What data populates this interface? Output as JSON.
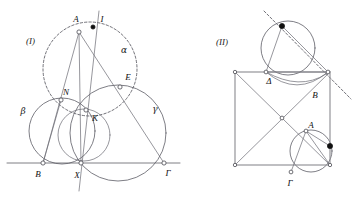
{
  "page": {
    "width": 363,
    "height": 200,
    "background": "#ffffff"
  },
  "colors": {
    "ink_main": "#5d5d66",
    "ink_thin": "#6a6a72",
    "ink_dash": "#4c4c55",
    "ink_square": "#8a8a90",
    "label_text": "#111111",
    "dot_filled": "#101010",
    "dot_open_fill": "#ffffff"
  },
  "figures": [
    {
      "id": "figure-one",
      "caption": "(I)",
      "caption_pos": {
        "x": 26,
        "y": 44
      },
      "point_labels": [
        {
          "name": "A",
          "text": "A",
          "x": 76,
          "y": 22
        },
        {
          "name": "I",
          "text": "I",
          "x": 102,
          "y": 22
        },
        {
          "name": "E",
          "text": "E",
          "x": 128,
          "y": 80
        },
        {
          "name": "N",
          "text": "N",
          "x": 66,
          "y": 95
        },
        {
          "name": "K",
          "text": "K",
          "x": 95,
          "y": 121
        },
        {
          "name": "B",
          "text": "B",
          "x": 38,
          "y": 177
        },
        {
          "name": "X",
          "text": "X",
          "x": 77,
          "y": 178
        },
        {
          "name": "G",
          "text": "Γ",
          "x": 168,
          "y": 176
        }
      ],
      "circle_labels": [
        {
          "name": "alpha",
          "text": "α",
          "x": 124,
          "y": 53
        },
        {
          "name": "beta",
          "text": "β",
          "x": 23,
          "y": 114
        },
        {
          "name": "gamma",
          "text": "γ",
          "x": 155,
          "y": 112
        }
      ],
      "circles": [
        {
          "name": "circle-alpha-dashed",
          "cx": 90,
          "cy": 69,
          "r": 47,
          "style": "dashed"
        },
        {
          "name": "circle-beta",
          "cx": 62,
          "cy": 131,
          "r": 33,
          "style": "solid"
        },
        {
          "name": "circle-gamma",
          "cx": 118,
          "cy": 133,
          "r": 48,
          "style": "solid"
        },
        {
          "name": "circle-small-K",
          "cx": 84,
          "cy": 135,
          "r": 26,
          "style": "solid"
        }
      ],
      "baseline": {
        "name": "line-B-Gamma",
        "x1": 7,
        "y1": 163,
        "x2": 180,
        "y2": 163
      },
      "segments": [
        {
          "name": "segment-A-B",
          "x1": 79,
          "y1": 32,
          "x2": 43,
          "y2": 163
        },
        {
          "name": "segment-A-Gamma",
          "x1": 79,
          "y1": 32,
          "x2": 164,
          "y2": 163
        },
        {
          "name": "segment-A-X",
          "x1": 79,
          "y1": 32,
          "x2": 81,
          "y2": 163
        },
        {
          "name": "segment-vertical-I",
          "x1": 98,
          "y1": 12,
          "x2": 80,
          "y2": 190
        },
        {
          "name": "segment-N-K",
          "x1": 61,
          "y1": 100,
          "x2": 99,
          "y2": 113
        },
        {
          "name": "segment-B-N",
          "x1": 43,
          "y1": 163,
          "x2": 61,
          "y2": 100
        }
      ],
      "marked_points": [
        {
          "name": "point-A",
          "x": 79,
          "y": 32,
          "kind": "open"
        },
        {
          "name": "point-I",
          "x": 93,
          "y": 27,
          "kind": "filled"
        },
        {
          "name": "point-E",
          "x": 120,
          "y": 87,
          "kind": "open"
        },
        {
          "name": "point-N",
          "x": 61,
          "y": 100,
          "kind": "open"
        },
        {
          "name": "point-K",
          "x": 86,
          "y": 110,
          "kind": "open"
        },
        {
          "name": "point-B",
          "x": 43,
          "y": 163,
          "kind": "open"
        },
        {
          "name": "point-X",
          "x": 81,
          "y": 163,
          "kind": "open"
        },
        {
          "name": "point-Gamma",
          "x": 164,
          "y": 163,
          "kind": "open"
        }
      ]
    },
    {
      "id": "figure-two",
      "caption": "(II)",
      "caption_pos": {
        "x": 216,
        "y": 45
      },
      "point_labels": [
        {
          "name": "Delta",
          "text": "Δ",
          "x": 269,
          "y": 84
        },
        {
          "name": "B",
          "text": "B",
          "x": 315,
          "y": 98
        },
        {
          "name": "A",
          "text": "A",
          "x": 311,
          "y": 128
        },
        {
          "name": "Gamma",
          "text": "Γ",
          "x": 290,
          "y": 186
        }
      ],
      "square": {
        "name": "square-outline",
        "x": 235,
        "y": 72,
        "w": 95,
        "h": 93
      },
      "diagonals": [
        {
          "name": "diagonal-tl-br",
          "x1": 235,
          "y1": 72,
          "x2": 330,
          "y2": 165
        },
        {
          "name": "diagonal-bl-tr",
          "x1": 235,
          "y1": 165,
          "x2": 330,
          "y2": 72
        }
      ],
      "circles": [
        {
          "name": "circle-top",
          "cx": 288,
          "cy": 48,
          "r": 27,
          "style": "solid"
        },
        {
          "name": "circle-bottom-right",
          "cx": 311,
          "cy": 151,
          "r": 21,
          "style": "solid"
        }
      ],
      "chords": [
        {
          "name": "chord-top-dot-to-Delta",
          "x1": 282,
          "y1": 26,
          "x2": 266,
          "y2": 72
        },
        {
          "name": "chord-top-dot-to-B",
          "x1": 282,
          "y1": 26,
          "x2": 328,
          "y2": 72
        },
        {
          "name": "chord-Delta-to-B",
          "x1": 266,
          "y1": 72,
          "x2": 328,
          "y2": 72
        },
        {
          "name": "chord-A-to-Gamma",
          "x1": 306,
          "y1": 131,
          "x2": 291,
          "y2": 172
        },
        {
          "name": "chord-A-to-corner",
          "x1": 306,
          "y1": 131,
          "x2": 330,
          "y2": 165
        },
        {
          "name": "chord-A-to-dot",
          "x1": 306,
          "y1": 131,
          "x2": 330,
          "y2": 146
        }
      ],
      "tangent_line": {
        "name": "tangent-dashed",
        "x1": 265,
        "y1": 12,
        "x2": 350,
        "y2": 98
      },
      "marked_points": [
        {
          "name": "point-top-dot",
          "x": 282,
          "y": 26,
          "kind": "filled"
        },
        {
          "name": "point-right-edge-dot",
          "x": 330,
          "y": 146,
          "kind": "filled"
        },
        {
          "name": "point-Delta",
          "x": 266,
          "y": 72,
          "kind": "open"
        },
        {
          "name": "point-B",
          "x": 328,
          "y": 72,
          "kind": "open"
        },
        {
          "name": "point-A",
          "x": 306,
          "y": 131,
          "kind": "open"
        },
        {
          "name": "point-Gamma",
          "x": 291,
          "y": 172,
          "kind": "open"
        },
        {
          "name": "point-center",
          "x": 282,
          "y": 118,
          "kind": "open"
        },
        {
          "name": "point-corner-tl",
          "x": 235,
          "y": 72,
          "kind": "open"
        },
        {
          "name": "point-corner-bl",
          "x": 235,
          "y": 165,
          "kind": "open"
        },
        {
          "name": "point-corner-br",
          "x": 330,
          "y": 165,
          "kind": "open"
        }
      ]
    }
  ]
}
